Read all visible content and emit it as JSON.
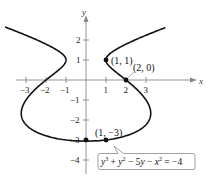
{
  "chart_data": {
    "type": "line",
    "title": "",
    "xlabel": "x",
    "ylabel": "y",
    "xlim": [
      -3.5,
      3.8
    ],
    "ylim": [
      -4.5,
      3.0
    ],
    "grid": false,
    "x_ticks": [
      -3,
      -2,
      -1,
      1,
      2,
      3
    ],
    "y_ticks": [
      -4,
      -3,
      -2,
      -1,
      1,
      2
    ],
    "x_tick_labels": [
      "−3",
      "−2",
      "−1",
      "1",
      "2",
      "3"
    ],
    "y_tick_labels": [
      "−4",
      "−3",
      "−2",
      "−1",
      "1",
      "2"
    ],
    "equation": "y³ + y² − 5y − x² = −4",
    "series": [
      {
        "name": "y^3 + y^2 - 5y - x^2 = -4",
        "description": "x = ±sqrt(y^3 + y^2 - 5y + 4)"
      }
    ],
    "points": [
      {
        "x": 1,
        "y": 1,
        "label": "(1, 1)"
      },
      {
        "x": 2,
        "y": 0,
        "label": "(2, 0)"
      },
      {
        "x": 1,
        "y": -3,
        "label": "(1, −3)"
      },
      {
        "x": 0,
        "y": -3,
        "label": ""
      }
    ]
  },
  "labels": {
    "x_axis": "x",
    "y_axis": "y",
    "tick_x_m3": "−3",
    "tick_x_m2": "−2",
    "tick_x_m1": "−1",
    "tick_x_1": "1",
    "tick_x_2": "2",
    "tick_x_3": "3",
    "tick_y_2": "2",
    "tick_y_1": "1",
    "tick_y_m1": "−1",
    "tick_y_m2": "−2",
    "tick_y_m3": "−3",
    "tick_y_m4": "−4",
    "pt_1_1": "(1, 1)",
    "pt_2_0": "(2, 0)",
    "pt_1_m3": "(1, −3)"
  }
}
